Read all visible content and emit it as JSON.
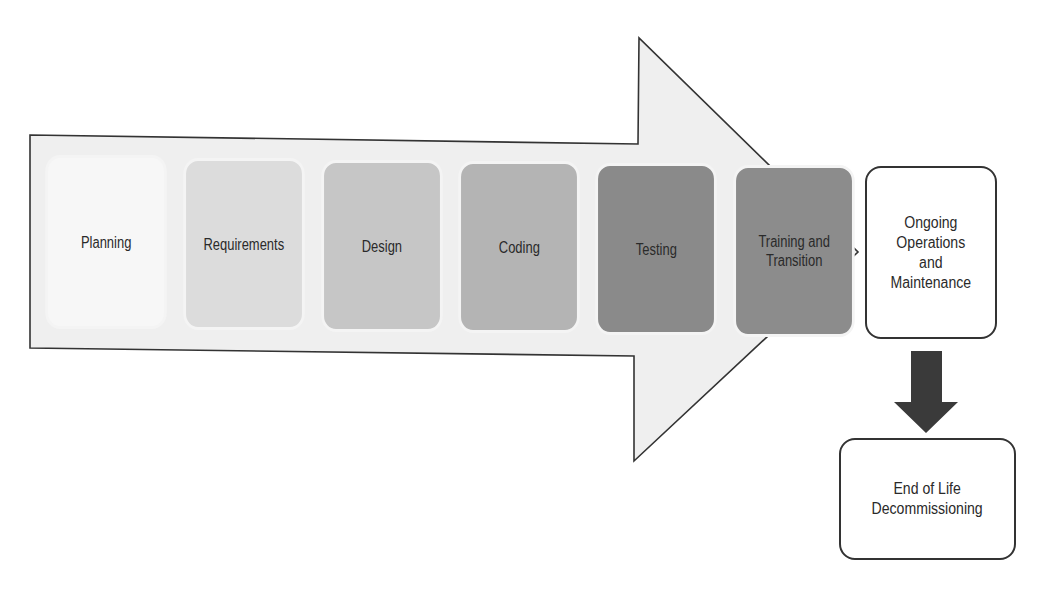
{
  "diagram": {
    "type": "process-flow",
    "main_arrow": {
      "fill": "#efefef",
      "stroke": "#333333"
    },
    "phases": [
      {
        "label": "Planning",
        "color": "#f7f7f7"
      },
      {
        "label": "Requirements",
        "color": "#dcdcdc"
      },
      {
        "label": "Design",
        "color": "#c6c6c6"
      },
      {
        "label": "Coding",
        "color": "#b4b4b4"
      },
      {
        "label": "Testing",
        "color": "#8a8a8a"
      },
      {
        "label": "Training and\nTransition",
        "color": "#8c8c8c"
      }
    ],
    "ongoing": {
      "label": "Ongoing\nOperations\nand\nMaintenance"
    },
    "down_arrow": {
      "color": "#3a3a3a"
    },
    "end_of_life": {
      "label": "End of Life\nDecommissioning"
    }
  }
}
